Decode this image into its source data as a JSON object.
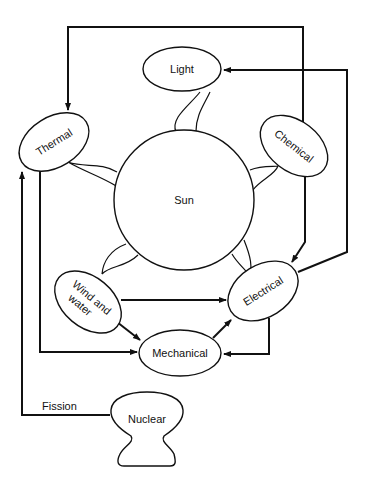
{
  "diagram": {
    "nodes": {
      "sun": {
        "label": "Sun"
      },
      "light": {
        "label": "Light"
      },
      "thermal": {
        "label": "Thermal"
      },
      "chemical": {
        "label": "Chemical"
      },
      "wind_water": {
        "label_line1": "Wind and",
        "label_line2": "water"
      },
      "electrical": {
        "label": "Electrical"
      },
      "mechanical": {
        "label": "Mechanical"
      },
      "nuclear": {
        "label": "Nuclear"
      }
    },
    "edge_labels": {
      "fission": "Fission"
    },
    "edges": [
      {
        "from": "Chemical",
        "to": "Thermal"
      },
      {
        "from": "Electrical",
        "to": "Light"
      },
      {
        "from": "Chemical",
        "to": "Electrical"
      },
      {
        "from": "Wind and water",
        "to": "Electrical"
      },
      {
        "from": "Wind and water",
        "to": "Mechanical"
      },
      {
        "from": "Mechanical",
        "to": "Electrical"
      },
      {
        "from": "Electrical",
        "to": "Mechanical"
      },
      {
        "from": "Thermal",
        "to": "Mechanical"
      },
      {
        "from": "Nuclear",
        "to": "Thermal",
        "label": "Fission"
      }
    ],
    "colors": {
      "stroke": "#111111",
      "background": "#ffffff"
    }
  }
}
